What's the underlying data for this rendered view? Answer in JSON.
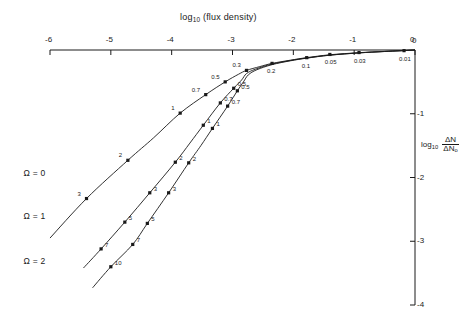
{
  "chart_data": {
    "type": "line",
    "title_html": "log<sub>10</sub> (flux density)",
    "xlabel": "log10 (flux density)",
    "ylabel": "log10 ΔN/ΔN0",
    "ylabel_parts": {
      "prefix": "log",
      "subscript": "10",
      "numerator": "ΔN",
      "denominator": "ΔN₀"
    },
    "xlim": [
      -6,
      0
    ],
    "ylim": [
      -4,
      0
    ],
    "x_ticks": [
      "-6",
      "-5",
      "-4",
      "-3",
      "-2",
      "-1",
      "0"
    ],
    "x_tick_values": [
      -6,
      -5,
      -4,
      -3,
      -2,
      -1,
      0
    ],
    "y_ticks": [
      "0",
      "-1",
      "-2",
      "-3",
      "-4"
    ],
    "y_tick_values": [
      0,
      -1,
      -2,
      -3,
      -4
    ],
    "x_axis_position": "top",
    "y_axis_position": "right",
    "grid": false,
    "legend": "inline-curve-labels",
    "series": [
      {
        "name": "Ω = 0",
        "label": "Ω = 0",
        "label_pos": {
          "x": -5.78,
          "y": -1.95
        },
        "points": [
          {
            "x": -5.4,
            "y": -2.33,
            "label": "3"
          },
          {
            "x": -4.72,
            "y": -1.73,
            "label": "2"
          },
          {
            "x": -3.86,
            "y": -0.99,
            "label": "1"
          },
          {
            "x": -3.44,
            "y": -0.7,
            "label": "0.7"
          },
          {
            "x": -3.12,
            "y": -0.5,
            "label": "0.5"
          },
          {
            "x": -2.77,
            "y": -0.32,
            "label": "0.3"
          },
          {
            "x": -2.35,
            "y": -0.21,
            "label": "0.2"
          },
          {
            "x": -1.78,
            "y": -0.12,
            "label": "0.1"
          },
          {
            "x": -1.4,
            "y": -0.07,
            "label": "0.05"
          },
          {
            "x": -0.92,
            "y": -0.04,
            "label": "0.03"
          },
          {
            "x": -0.18,
            "y": -0.01,
            "label": "0.01"
          }
        ],
        "path": [
          {
            "x": -6.0,
            "y": -2.95
          },
          {
            "x": -5.4,
            "y": -2.33
          },
          {
            "x": -4.72,
            "y": -1.73
          },
          {
            "x": -4.3,
            "y": -1.38
          },
          {
            "x": -3.86,
            "y": -0.99
          },
          {
            "x": -3.44,
            "y": -0.7
          },
          {
            "x": -3.12,
            "y": -0.5
          },
          {
            "x": -2.9,
            "y": -0.38
          },
          {
            "x": -2.77,
            "y": -0.32
          },
          {
            "x": -2.55,
            "y": -0.26
          },
          {
            "x": -2.35,
            "y": -0.21
          },
          {
            "x": -2.05,
            "y": -0.16
          },
          {
            "x": -1.78,
            "y": -0.12
          },
          {
            "x": -1.4,
            "y": -0.075
          },
          {
            "x": -0.92,
            "y": -0.042
          },
          {
            "x": -0.5,
            "y": -0.022
          },
          {
            "x": -0.18,
            "y": -0.009
          },
          {
            "x": 0.0,
            "y": 0.0
          }
        ]
      },
      {
        "name": "Ω = 1",
        "label": "Ω = 1",
        "label_pos": {
          "x": -5.78,
          "y": -2.62
        },
        "points": [
          {
            "x": -5.16,
            "y": -3.12,
            "label": "7"
          },
          {
            "x": -4.77,
            "y": -2.7,
            "label": "5"
          },
          {
            "x": -4.36,
            "y": -2.24,
            "label": "3"
          },
          {
            "x": -3.94,
            "y": -1.76,
            "label": "2"
          },
          {
            "x": -3.48,
            "y": -1.18,
            "label": "1"
          },
          {
            "x": -3.2,
            "y": -0.83,
            "label": "0.7"
          },
          {
            "x": -2.98,
            "y": -0.6,
            "label": "0.5"
          }
        ],
        "path": [
          {
            "x": -5.45,
            "y": -3.42
          },
          {
            "x": -5.16,
            "y": -3.12
          },
          {
            "x": -4.77,
            "y": -2.7
          },
          {
            "x": -4.36,
            "y": -2.24
          },
          {
            "x": -3.94,
            "y": -1.76
          },
          {
            "x": -3.7,
            "y": -1.46
          },
          {
            "x": -3.48,
            "y": -1.18
          },
          {
            "x": -3.2,
            "y": -0.83
          },
          {
            "x": -2.98,
            "y": -0.6
          },
          {
            "x": -2.85,
            "y": -0.47
          },
          {
            "x": -2.77,
            "y": -0.37
          },
          {
            "x": -2.62,
            "y": -0.3
          },
          {
            "x": -2.35,
            "y": -0.22
          },
          {
            "x": -2.05,
            "y": -0.165
          },
          {
            "x": -1.78,
            "y": -0.125
          },
          {
            "x": -1.4,
            "y": -0.08
          },
          {
            "x": -0.92,
            "y": -0.045
          },
          {
            "x": -0.5,
            "y": -0.023
          },
          {
            "x": 0.0,
            "y": 0.0
          }
        ]
      },
      {
        "name": "Ω = 2",
        "label": "Ω = 2",
        "label_pos": {
          "x": -5.78,
          "y": -3.32
        },
        "points": [
          {
            "x": -5.0,
            "y": -3.4,
            "label": "10"
          },
          {
            "x": -4.64,
            "y": -3.05,
            "label": "7"
          },
          {
            "x": -4.4,
            "y": -2.72,
            "label": "5"
          },
          {
            "x": -4.05,
            "y": -2.24,
            "label": "3"
          },
          {
            "x": -3.72,
            "y": -1.77,
            "label": "2"
          },
          {
            "x": -3.33,
            "y": -1.23,
            "label": "1"
          },
          {
            "x": -3.08,
            "y": -0.88,
            "label": "0.7"
          },
          {
            "x": -2.92,
            "y": -0.64,
            "label": "0.5"
          }
        ],
        "path": [
          {
            "x": -5.3,
            "y": -3.73
          },
          {
            "x": -5.0,
            "y": -3.4
          },
          {
            "x": -4.64,
            "y": -3.05
          },
          {
            "x": -4.4,
            "y": -2.72
          },
          {
            "x": -4.05,
            "y": -2.24
          },
          {
            "x": -3.72,
            "y": -1.77
          },
          {
            "x": -3.52,
            "y": -1.5
          },
          {
            "x": -3.33,
            "y": -1.23
          },
          {
            "x": -3.08,
            "y": -0.88
          },
          {
            "x": -2.92,
            "y": -0.64
          },
          {
            "x": -2.82,
            "y": -0.5
          },
          {
            "x": -2.74,
            "y": -0.39
          },
          {
            "x": -2.6,
            "y": -0.31
          },
          {
            "x": -2.35,
            "y": -0.23
          },
          {
            "x": -2.05,
            "y": -0.17
          },
          {
            "x": -1.78,
            "y": -0.128
          },
          {
            "x": -1.4,
            "y": -0.082
          },
          {
            "x": -0.92,
            "y": -0.046
          },
          {
            "x": -0.5,
            "y": -0.024
          },
          {
            "x": 0.0,
            "y": 0.0
          }
        ]
      }
    ]
  }
}
